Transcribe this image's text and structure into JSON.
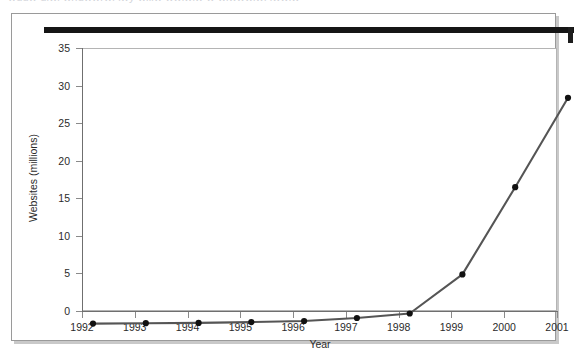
{
  "artifact": {
    "clipped_top_text": "wuuw uiwi wnuwwrwi iwy wiiiw wwiwiw w wiwwwiwi iwwiw"
  },
  "chart_data": {
    "type": "line",
    "title": "",
    "xlabel": "Year",
    "ylabel": "Websites (millions)",
    "categories": [
      "1992",
      "1993",
      "1994",
      "1995",
      "1996",
      "1997",
      "1998",
      "1999",
      "2000",
      "2001"
    ],
    "values": [
      0.05,
      0.1,
      0.15,
      0.25,
      0.4,
      0.8,
      1.4,
      6.6,
      18.2,
      30.1
    ],
    "series": [
      {
        "name": "Websites",
        "values": [
          0.05,
          0.1,
          0.15,
          0.25,
          0.4,
          0.8,
          1.4,
          6.6,
          18.2,
          30.1
        ]
      }
    ],
    "x": [
      1992,
      1993,
      1994,
      1995,
      1996,
      1997,
      1998,
      1999,
      2000,
      2001
    ],
    "ylim": [
      0,
      35
    ],
    "xlim": [
      1992,
      2001
    ],
    "yticks": [
      0,
      5,
      10,
      15,
      20,
      25,
      30,
      35
    ],
    "ytick_labels": [
      "0",
      "5",
      "10",
      "15",
      "20",
      "25",
      "30",
      "35"
    ],
    "xticks": [
      1992,
      1993,
      1994,
      1995,
      1996,
      1997,
      1998,
      1999,
      2000,
      2001
    ],
    "xtick_labels": [
      "1992",
      "1993",
      "1994",
      "1995",
      "1996",
      "1997",
      "1998",
      "1999",
      "2000",
      "2001"
    ],
    "grid": false,
    "legend": false,
    "legend_position": "none",
    "marker": "circle",
    "line_color": "#555555",
    "marker_color": "#111111",
    "frame_color": "#b4b4b4",
    "background_color": "#ffffff"
  }
}
